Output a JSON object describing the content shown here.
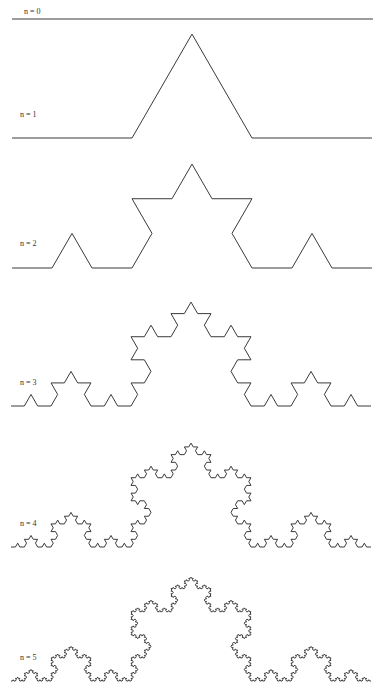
{
  "figure": {
    "width": 381,
    "height": 695,
    "stroke_color": "#3a3a3a",
    "label_color": "#333333",
    "background": "#ffffff"
  },
  "iterations": [
    {
      "n": 0,
      "label": "n = 0",
      "label_x": 24,
      "label_y": 14,
      "x_start": 12,
      "x_end": 373,
      "baseline_y": 19
    },
    {
      "n": 1,
      "label": "n = 1",
      "label_x": 20,
      "label_y": 117,
      "x_start": 12,
      "x_end": 372,
      "baseline_y": 138
    },
    {
      "n": 2,
      "label": "n = 2",
      "label_x": 20,
      "label_y": 246,
      "x_start": 12,
      "x_end": 372,
      "baseline_y": 268
    },
    {
      "n": 3,
      "label": "n = 3",
      "label_x": 20,
      "label_y": 385,
      "x_start": 11,
      "x_end": 371,
      "baseline_y": 406
    },
    {
      "n": 4,
      "label": "n = 4",
      "label_x": 20,
      "label_y": 526,
      "x_start": 11,
      "x_end": 371,
      "baseline_y": 547
    },
    {
      "n": 5,
      "label": "n = 5",
      "label_x": 20,
      "label_y": 660,
      "x_start": 11,
      "x_end": 371,
      "baseline_y": 681
    }
  ]
}
